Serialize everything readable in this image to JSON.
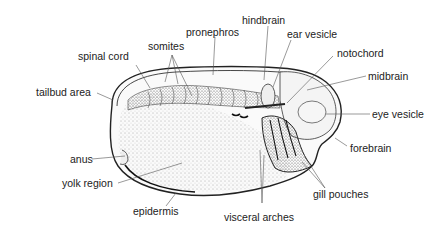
{
  "diagram": {
    "labels": {
      "pronephros": "pronephros",
      "hindbrain": "hindbrain",
      "ear_vesicle": "ear vesicle",
      "somites": "somites",
      "spinal_cord": "spinal cord",
      "notochord": "notochord",
      "midbrain": "midbrain",
      "tailbud_area": "tailbud area",
      "eye_vesicle": "eye vesicle",
      "forebrain": "forebrain",
      "anus": "anus",
      "yolk_region": "yolk region",
      "gill_pouches": "gill pouches",
      "epidermis": "epidermis",
      "visceral_arches": "visceral arches"
    }
  }
}
